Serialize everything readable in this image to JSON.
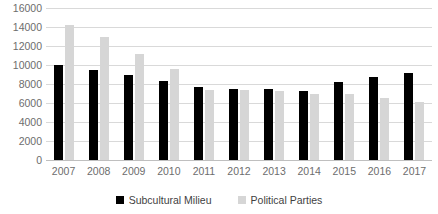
{
  "chart_data": {
    "type": "bar",
    "title": "",
    "subtitle": "",
    "xlabel": "",
    "ylabel": "",
    "categories": [
      "2007",
      "2008",
      "2009",
      "2010",
      "2011",
      "2012",
      "2013",
      "2014",
      "2015",
      "2016",
      "2017"
    ],
    "series": [
      {
        "name": "Subcultural Milieu",
        "color": "#000000",
        "values": [
          10000,
          9500,
          9000,
          8300,
          7700,
          7500,
          7500,
          7300,
          8200,
          8700,
          9200
        ]
      },
      {
        "name": "Political Parties",
        "color": "#D6D6D6",
        "values": [
          14200,
          13000,
          11200,
          9600,
          7400,
          7400,
          7300,
          7000,
          6900,
          6500,
          6100
        ]
      }
    ],
    "ylim": [
      0,
      16000
    ],
    "ytick_step": 2000,
    "yticks": [
      "16000",
      "14000",
      "12000",
      "10000",
      "8000",
      "6000",
      "4000",
      "2000",
      "0"
    ],
    "grid": true,
    "legend_position": "bottom"
  },
  "legend": {
    "items": [
      {
        "label": "Subcultural Milieu",
        "color": "#000000"
      },
      {
        "label": "Political Parties",
        "color": "#D6D6D6"
      }
    ]
  }
}
